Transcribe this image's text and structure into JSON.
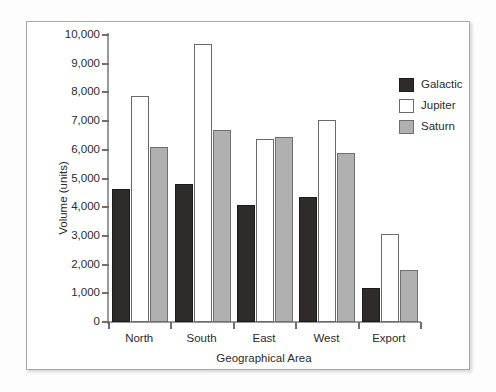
{
  "chart_data": {
    "type": "bar",
    "title": "",
    "xlabel": "Geographical Area",
    "ylabel": "Volume (units)",
    "categories": [
      "North",
      "South",
      "East",
      "West",
      "Export"
    ],
    "series": [
      {
        "name": "Galactic",
        "color": "#2e2b2a",
        "values": [
          4640,
          4810,
          4070,
          4360,
          1190
        ]
      },
      {
        "name": "Jupiter",
        "color": "#ffffff",
        "values": [
          7870,
          9690,
          6380,
          7040,
          3060
        ]
      },
      {
        "name": "Saturn",
        "color": "#b0b0b0",
        "values": [
          6100,
          6690,
          6450,
          5890,
          1820
        ]
      }
    ],
    "ylim": [
      0,
      10000
    ],
    "ytick_values": [
      0,
      1000,
      2000,
      3000,
      4000,
      5000,
      6000,
      7000,
      8000,
      9000,
      10000
    ],
    "ytick_labels": [
      "0",
      "1,000",
      "2,000",
      "3,000",
      "4,000",
      "5,000",
      "6,000",
      "7,000",
      "8,000",
      "9,000",
      "10,000"
    ],
    "grid": false,
    "legend_position": "top-right"
  },
  "legend": {
    "entries": [
      {
        "label": "Galactic"
      },
      {
        "label": "Jupiter"
      },
      {
        "label": "Saturn"
      }
    ]
  }
}
